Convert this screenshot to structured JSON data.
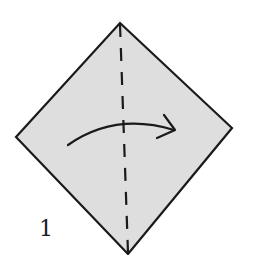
{
  "diagram": {
    "type": "origami-step",
    "step_number": "1",
    "shape": "square-diamond",
    "fill_color": "#dedede",
    "stroke_color": "#1a1a1a",
    "fold_line": "valley-fold-vertical",
    "arrow_direction": "left-to-right",
    "vertices": {
      "top": [
        120,
        23
      ],
      "right": [
        232,
        128
      ],
      "bottom": [
        128,
        254
      ],
      "left": [
        16,
        137
      ]
    }
  }
}
